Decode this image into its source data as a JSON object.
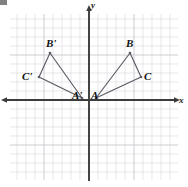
{
  "figure": {
    "type": "coordinate-plane-geometry-diagram",
    "background_color": "#ffffff",
    "grid_color": "#d9d9de",
    "grid_major_color": "#c8c8d0",
    "axis_color": "#3c3c3c",
    "shape_color": "#5a5a64",
    "label_color": "#111111"
  },
  "axes": {
    "x_label": "x",
    "y_label": "y",
    "origin_px": {
      "x": 89,
      "y": 100
    },
    "x_axis_y_px": 100,
    "y_axis_x_px": 89,
    "x_label_px": {
      "x": 179,
      "y": 96
    },
    "y_label_px": {
      "x": 91,
      "y": 1
    },
    "x_arrow_left_px": {
      "x": 6,
      "y": 100
    },
    "x_arrow_right_px": {
      "x": 175,
      "y": 100
    },
    "y_arrow_top_px": {
      "x": 89,
      "y": 12
    },
    "y_axis_bottom_px": {
      "x": 89,
      "y": 181
    }
  },
  "grid": {
    "cell_size_px": 9,
    "left_px": 10,
    "right_px": 178,
    "top_px": 14,
    "bottom_px": 180,
    "major_every": 5,
    "visible": true
  },
  "chart_data": {
    "type": "scatter",
    "title": "",
    "xlabel": "x",
    "ylabel": "y",
    "grid": true,
    "legend": false,
    "shapes": [
      {
        "name": "triangle-ABC",
        "vertices": [
          {
            "label": "A",
            "px": {
              "x": 96,
              "y": 98
            },
            "grid": {
              "x": 1,
              "y": 0
            }
          },
          {
            "label": "B",
            "px": {
              "x": 130,
              "y": 53
            },
            "grid": {
              "x": 4.5,
              "y": 5
            }
          },
          {
            "label": "C",
            "px": {
              "x": 141,
              "y": 77
            },
            "grid": {
              "x": 5.5,
              "y": 2.5
            }
          }
        ],
        "labels": [
          {
            "text": "A",
            "px": {
              "x": 91,
              "y": 90
            }
          },
          {
            "text": "B",
            "px": {
              "x": 126,
              "y": 38
            }
          },
          {
            "text": "C",
            "px": {
              "x": 144,
              "y": 71
            }
          }
        ]
      },
      {
        "name": "triangle-A-prime-B-prime-C-prime",
        "vertices": [
          {
            "label": "A'",
            "px": {
              "x": 82,
              "y": 98
            },
            "grid": {
              "x": -1,
              "y": 0
            }
          },
          {
            "label": "B'",
            "px": {
              "x": 50,
              "y": 53
            },
            "grid": {
              "x": -4.5,
              "y": 5
            }
          },
          {
            "label": "C'",
            "px": {
              "x": 39,
              "y": 77
            },
            "grid": {
              "x": -5.5,
              "y": 2.5
            }
          }
        ],
        "labels": [
          {
            "text": "A'",
            "px": {
              "x": 72,
              "y": 90
            }
          },
          {
            "text": "B'",
            "px": {
              "x": 46,
              "y": 38
            }
          },
          {
            "text": "C'",
            "px": {
              "x": 22,
              "y": 71
            }
          }
        ]
      }
    ]
  },
  "point_labels": {
    "a": "A",
    "b": "B",
    "c": "C",
    "a_prime": "A'",
    "b_prime": "B'",
    "c_prime": "C'"
  }
}
